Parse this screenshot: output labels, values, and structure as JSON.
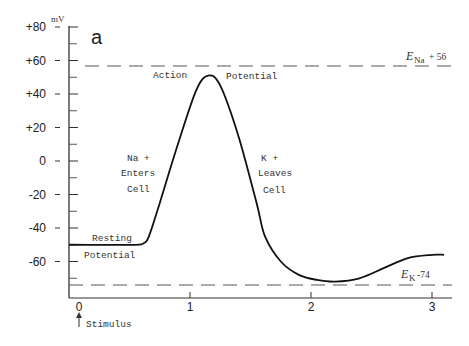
{
  "chart_data": {
    "type": "line",
    "title": "",
    "panel_label": "a",
    "ylabel": "mV",
    "xlabel": "",
    "ylim": [
      -80,
      80
    ],
    "xlim": [
      0,
      3.1
    ],
    "y_ticks": [
      "+80",
      "+60",
      "+40",
      "+20",
      "0",
      "-20",
      "-40",
      "-60"
    ],
    "x_ticks": [
      "0",
      "1",
      "2",
      "3"
    ],
    "grid": false,
    "series": [
      {
        "name": "Membrane potential",
        "x": [
          0,
          0.3,
          0.55,
          0.62,
          0.66,
          0.75,
          0.9,
          1.05,
          1.15,
          1.25,
          1.4,
          1.55,
          1.62,
          1.75,
          1.9,
          2.05,
          2.2,
          2.4,
          2.6,
          2.8,
          3.0,
          3.1
        ],
        "y": [
          -50,
          -50,
          -50,
          -49,
          -45,
          -25,
          10,
          42,
          51,
          45,
          15,
          -25,
          -45,
          -60,
          -68,
          -71,
          -72,
          -70,
          -64,
          -58,
          -56,
          -56
        ]
      }
    ],
    "reference_lines": [
      {
        "name": "E_Na",
        "label_main": "E",
        "label_sub": "Na",
        "label_value": "+ 56",
        "y": 56,
        "style": "dashed"
      },
      {
        "name": "E_K",
        "label_main": "E",
        "label_sub": "K",
        "label_value": "-74",
        "y": -74,
        "style": "dashed"
      }
    ],
    "annotations": {
      "action": "Action",
      "potential": "Potential",
      "na_line1": "Na +",
      "na_line2": "Enters",
      "na_line3": "Cell",
      "k_line1": "K +",
      "k_line2": "Leaves",
      "k_line3": "Cell",
      "resting_line1": "Resting",
      "resting_line2": "Potential",
      "stimulus": "Stimulus"
    }
  }
}
